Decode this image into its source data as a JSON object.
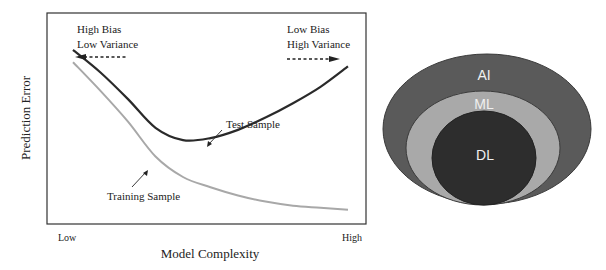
{
  "chart_data": {
    "type": "line",
    "title": "",
    "xlabel": "Model Complexity",
    "ylabel": "Prediction Error",
    "x_ticks": [
      "Low",
      "High"
    ],
    "xlim": [
      0,
      1
    ],
    "ylim": [
      0,
      1
    ],
    "grid": false,
    "series": [
      {
        "name": "Test Sample",
        "color": "#2a2a2a",
        "x": [
          0.0,
          0.1,
          0.2,
          0.3,
          0.4,
          0.5,
          0.6,
          0.7,
          0.8,
          0.9,
          1.0
        ],
        "y": [
          0.82,
          0.71,
          0.58,
          0.44,
          0.38,
          0.39,
          0.43,
          0.49,
          0.56,
          0.64,
          0.74
        ]
      },
      {
        "name": "Training Sample",
        "color": "#a8a8a8",
        "x": [
          0.0,
          0.1,
          0.2,
          0.3,
          0.4,
          0.5,
          0.6,
          0.7,
          0.8,
          0.9,
          1.0
        ],
        "y": [
          0.76,
          0.62,
          0.47,
          0.3,
          0.2,
          0.15,
          0.11,
          0.08,
          0.06,
          0.05,
          0.04
        ]
      }
    ],
    "annotations": [
      {
        "id": "left",
        "lines": [
          "High Bias",
          "Low Variance"
        ],
        "arrow": "left"
      },
      {
        "id": "right",
        "lines": [
          "Low Bias",
          "High Variance"
        ],
        "arrow": "right"
      },
      {
        "id": "test",
        "text": "Test Sample",
        "points_to": "Test Sample"
      },
      {
        "id": "train",
        "text": "Training Sample",
        "points_to": "Training Sample"
      }
    ]
  },
  "venn": {
    "sets": [
      {
        "label": "AI",
        "color": "#5a5a5a"
      },
      {
        "label": "ML",
        "color": "#a9a9a9"
      },
      {
        "label": "DL",
        "color": "#2d2d2d"
      }
    ]
  }
}
